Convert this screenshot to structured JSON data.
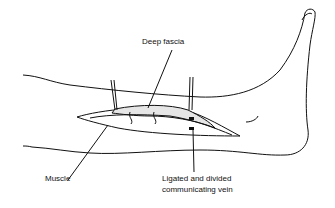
{
  "diagram": {
    "labels": {
      "deep_fascia": "Deep fascia",
      "muscle": "Muscle",
      "vein_line1": "Ligated and divided",
      "vein_line2": "communicating vein"
    },
    "colors": {
      "line": "#111111",
      "fascia_fill": "#e6e6e6",
      "background": "#ffffff"
    }
  }
}
